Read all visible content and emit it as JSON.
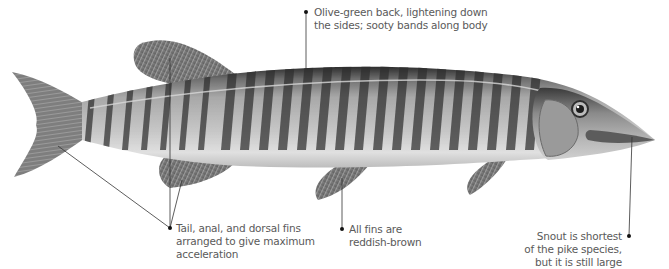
{
  "figure": {
    "colors": {
      "background": "#ffffff",
      "annotation_text": "#5a5a5a",
      "leader_line": "#333333",
      "body_light": "#d9d9d9",
      "body_dark": "#3a3a3a",
      "fin": "#7a7a7a"
    }
  },
  "annotations": [
    {
      "id": "back",
      "lines": [
        "Olive-green back, lightening down",
        "the sides; sooty bands along body"
      ]
    },
    {
      "id": "fins-arrangement",
      "lines": [
        "Tail, anal, and dorsal fins",
        "arranged to give maximum",
        "acceleration"
      ]
    },
    {
      "id": "fin-color",
      "lines": [
        "All fins are",
        "reddish-brown"
      ]
    },
    {
      "id": "snout",
      "lines": [
        "Snout is shortest",
        "of the pike species,",
        "but it is still large"
      ]
    }
  ]
}
